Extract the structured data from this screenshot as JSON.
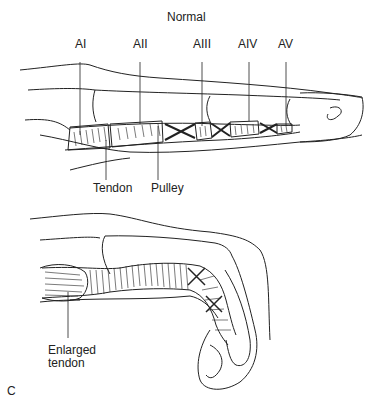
{
  "figure": {
    "title": "Normal",
    "panel_label": "C",
    "top_diagram": {
      "pulley_labels": [
        "AI",
        "AII",
        "AIII",
        "AIV",
        "AV"
      ],
      "tendon_label": "Tendon",
      "pulley_label": "Pulley"
    },
    "bottom_diagram": {
      "enlarged_tendon_label_line1": "Enlarged",
      "enlarged_tendon_label_line2": "tendon"
    },
    "colors": {
      "line": "#222222",
      "background": "#ffffff"
    }
  }
}
